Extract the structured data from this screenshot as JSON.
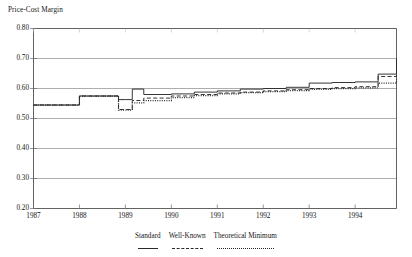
{
  "axis_title": "Price-Cost Margin",
  "legend": {
    "entries": [
      {
        "label": "Standard",
        "style": "solid"
      },
      {
        "label": "Well-Known",
        "style": "dashed"
      },
      {
        "label": "Theoretical Minimum",
        "style": "dotted"
      }
    ]
  },
  "chart_data": {
    "type": "line",
    "title": "Price-Cost Margin",
    "xlabel": "",
    "ylabel": "Price-Cost Margin",
    "xlim": [
      1987,
      1994.9
    ],
    "ylim": [
      0.2,
      0.8
    ],
    "yticks": [
      "0.20",
      "0.30",
      "0.40",
      "0.50",
      "0.60",
      "0.70",
      "0.80"
    ],
    "ytick_values": [
      0.2,
      0.3,
      0.4,
      0.5,
      0.6,
      0.7,
      0.8
    ],
    "xticks": [
      "1987",
      "1988",
      "1989",
      "1990",
      "1991",
      "1992",
      "1993",
      "1994"
    ],
    "xtick_values": [
      1987,
      1988,
      1989,
      1990,
      1991,
      1992,
      1993,
      1994
    ],
    "grid": "horizontal",
    "legend_position": "below",
    "interpolation": "step-post",
    "series": [
      {
        "name": "Standard",
        "style": "solid",
        "color": "#2b2b2b",
        "x": [
          1987.0,
          1987.5,
          1988.0,
          1988.5,
          1988.85,
          1989.0,
          1989.15,
          1989.4,
          1990.0,
          1990.5,
          1991.0,
          1991.5,
          1992.0,
          1992.5,
          1993.0,
          1993.5,
          1994.0,
          1994.5,
          1994.9
        ],
        "y": [
          0.545,
          0.545,
          0.575,
          0.575,
          0.563,
          0.563,
          0.598,
          0.58,
          0.582,
          0.588,
          0.592,
          0.598,
          0.6,
          0.604,
          0.618,
          0.62,
          0.622,
          0.648,
          0.7
        ]
      },
      {
        "name": "Well-Known",
        "style": "dashed",
        "color": "#2b2b2b",
        "x": [
          1987.0,
          1987.5,
          1988.0,
          1988.5,
          1988.85,
          1989.0,
          1989.15,
          1989.4,
          1990.0,
          1990.5,
          1991.0,
          1991.5,
          1992.0,
          1992.5,
          1993.0,
          1993.5,
          1994.0,
          1994.5,
          1994.9
        ],
        "y": [
          0.545,
          0.545,
          0.575,
          0.575,
          0.53,
          0.53,
          0.56,
          0.568,
          0.575,
          0.58,
          0.585,
          0.588,
          0.592,
          0.596,
          0.6,
          0.603,
          0.606,
          0.64,
          0.675
        ]
      },
      {
        "name": "Theoretical Minimum",
        "style": "dotted",
        "color": "#2b2b2b",
        "x": [
          1987.0,
          1987.5,
          1988.0,
          1988.5,
          1988.85,
          1989.0,
          1989.15,
          1989.4,
          1990.0,
          1990.5,
          1991.0,
          1991.5,
          1992.0,
          1992.5,
          1993.0,
          1993.5,
          1994.0,
          1994.5,
          1994.9
        ],
        "y": [
          0.545,
          0.545,
          0.575,
          0.575,
          0.528,
          0.528,
          0.552,
          0.56,
          0.57,
          0.576,
          0.582,
          0.586,
          0.59,
          0.593,
          0.597,
          0.6,
          0.602,
          0.618,
          0.63
        ]
      }
    ]
  }
}
